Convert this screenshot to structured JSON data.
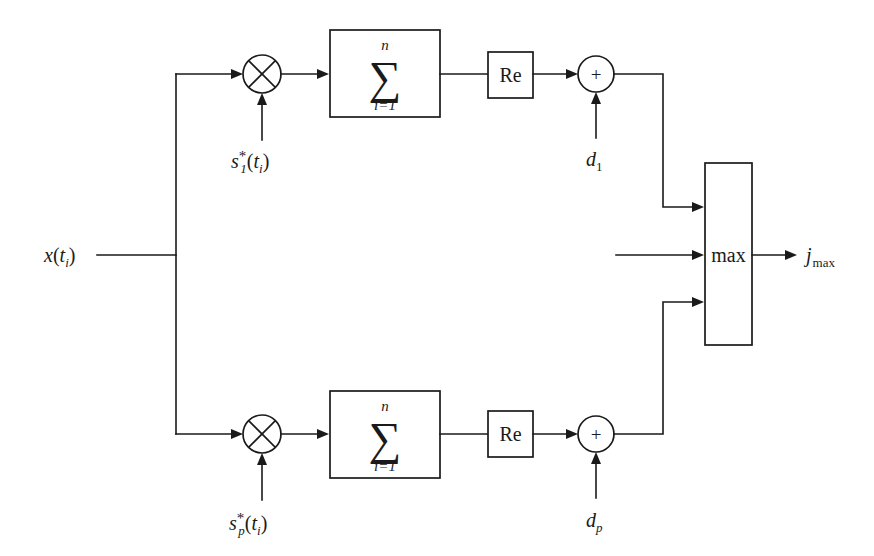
{
  "diagram": {
    "background_color": "#ffffff",
    "line_color": "#1a1a1a",
    "input": {
      "name": "x(t_i)",
      "symbol": "x",
      "open_paren": "(",
      "arg": "t",
      "arg_sub": "i",
      "close_paren": ")"
    },
    "output": {
      "name": "j_max",
      "symbol": "j",
      "sub": "max"
    },
    "max_block": {
      "label": "max"
    },
    "branches": [
      {
        "id": "branch-1",
        "multiplier": {
          "operator": "×",
          "reference_label": {
            "symbol": "s",
            "sup": "*",
            "sub": "1",
            "open_paren": "(",
            "arg": "t",
            "arg_sub": "i",
            "close_paren": ")",
            "text": "s*_1(t_i)"
          }
        },
        "summation": {
          "operator": "∑",
          "upper_limit": "n",
          "lower_limit": "i=1",
          "lower_index": "i",
          "lower_equals": "=",
          "lower_start": "1"
        },
        "real_part": {
          "label": "Re"
        },
        "adder": {
          "operator": "+",
          "bias_label": {
            "symbol": "d",
            "sub": "1",
            "text": "d_1"
          }
        }
      },
      {
        "id": "branch-p",
        "multiplier": {
          "operator": "×",
          "reference_label": {
            "symbol": "s",
            "sup": "*",
            "sub": "p",
            "open_paren": "(",
            "arg": "t",
            "arg_sub": "i",
            "close_paren": ")",
            "text": "s*_p(t_i)"
          }
        },
        "summation": {
          "operator": "∑",
          "upper_limit": "n",
          "lower_limit": "i=1",
          "lower_index": "i",
          "lower_equals": "=",
          "lower_start": "1"
        },
        "real_part": {
          "label": "Re"
        },
        "adder": {
          "operator": "+",
          "bias_label": {
            "symbol": "d",
            "sub": "p",
            "text": "d_p"
          }
        }
      }
    ]
  }
}
